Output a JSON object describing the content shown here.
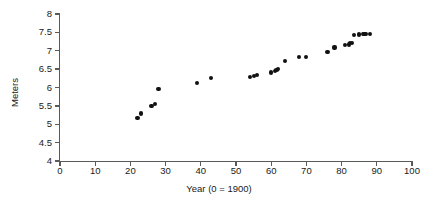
{
  "chart_data": {
    "type": "scatter",
    "title": "",
    "subtitle": "",
    "xlabel": "Year (0 = 1900)",
    "ylabel": "Meters",
    "xlim": [
      0,
      100
    ],
    "ylim": [
      4,
      8
    ],
    "xticks": [
      0,
      10,
      20,
      30,
      40,
      50,
      60,
      70,
      80,
      90,
      100
    ],
    "xtick_labels": [
      "0",
      "10",
      "20",
      "30",
      "40",
      "50",
      "60",
      "70",
      "80",
      "90",
      "100"
    ],
    "yticks": [
      4,
      4.5,
      5,
      5.5,
      6,
      6.5,
      7,
      7.5,
      8
    ],
    "ytick_labels": [
      "4",
      "4.5",
      "5",
      "5.5",
      "6",
      "6.5",
      "7",
      "7.5",
      "8"
    ],
    "grid": false,
    "legend": null,
    "marker": "filled-circle",
    "marker_color": "#111111",
    "axis_color": "#5a5a5a",
    "background": "#ffffff",
    "series": [
      {
        "name": "Pole vault record",
        "x": [
          22,
          23,
          26,
          27,
          28,
          39,
          43,
          54,
          55,
          56,
          60,
          61,
          61.5,
          62,
          64,
          68,
          70,
          76,
          78,
          81,
          82,
          82.5,
          83,
          83.5,
          85,
          86,
          86.5,
          87,
          88
        ],
        "y": [
          5.17,
          5.29,
          5.49,
          5.56,
          5.97,
          6.12,
          6.25,
          6.29,
          6.31,
          6.33,
          6.41,
          6.45,
          6.48,
          6.51,
          6.73,
          6.83,
          6.84,
          6.96,
          7.09,
          7.15,
          7.17,
          7.2,
          7.21,
          7.42,
          7.44,
          7.45,
          7.45,
          7.46,
          7.46
        ]
      }
    ]
  },
  "figure": {
    "caption": ""
  }
}
